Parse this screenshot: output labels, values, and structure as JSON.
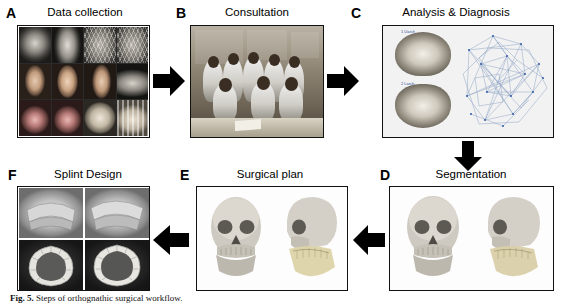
{
  "figure": {
    "panels": [
      {
        "letter": "A",
        "title": "Data collection",
        "content_type": "photo-grid",
        "tiles": [
          "lateral-cephalogram",
          "frontal-cephalogram",
          "3d-face-mesh",
          "3d-face-mesh-lateral",
          "frontal-face-photo",
          "smiling-face-photo",
          "profile-face-photo",
          "panoramic-radiograph",
          "intraoral-frontal-photo",
          "intraoral-lateral-photo",
          "dental-cast-upper",
          "dental-cast-lower"
        ]
      },
      {
        "letter": "B",
        "title": "Consultation",
        "content_type": "photograph",
        "tiles": [
          "clinical-team-meeting-photo"
        ]
      },
      {
        "letter": "C",
        "title": "Analysis & Diagnosis",
        "content_type": "cbct-analysis",
        "tiles": [
          "cbct-axial-upper-arch",
          "cbct-axial-lower-arch",
          "cephalometric-landmark-mesh"
        ],
        "labels": [
          "1 Uarch",
          "2 Larch"
        ]
      },
      {
        "letter": "D",
        "title": "Segmentation",
        "content_type": "3d-skull",
        "tiles": [
          "skull-frontal-view",
          "skull-lateral-view-segmented"
        ]
      },
      {
        "letter": "E",
        "title": "Surgical plan",
        "content_type": "3d-skull",
        "tiles": [
          "skull-frontal-view-planned",
          "skull-lateral-view-planned"
        ]
      },
      {
        "letter": "F",
        "title": "Splint Design",
        "content_type": "splint-grid",
        "tiles": [
          "splint-design-render-1",
          "splint-design-render-2",
          "splint-occlusal-view-1",
          "splint-occlusal-view-2"
        ]
      }
    ],
    "arrows": [
      {
        "name": "arrow-a-to-b",
        "direction": "right"
      },
      {
        "name": "arrow-b-to-c",
        "direction": "right"
      },
      {
        "name": "arrow-c-to-d",
        "direction": "down"
      },
      {
        "name": "arrow-d-to-e",
        "direction": "left"
      },
      {
        "name": "arrow-e-to-f",
        "direction": "left"
      }
    ],
    "caption": {
      "label": "Fig. 5.",
      "text": "Steps of orthognathic surgical workflow."
    }
  }
}
